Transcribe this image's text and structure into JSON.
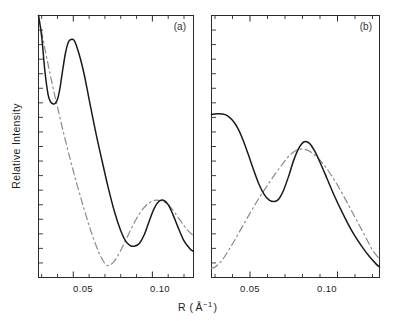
{
  "figure": {
    "xlabel_main": "R (",
    "xlabel_unit": "Å",
    "xlabel_exp": "−1",
    "xlabel_close": ")",
    "xlabel_full": "R ( Å⁻¹ )",
    "ylabel": "Relative Intensity",
    "background_color": "#ffffff",
    "solid_color": "#1a1a1a",
    "dashed_color": "#8a8a8a"
  },
  "panels": [
    {
      "label": "(a)",
      "xticks": [
        {
          "value": 0.05,
          "label": "0.05"
        },
        {
          "value": 0.1,
          "label": "0.10"
        }
      ]
    },
    {
      "label": "(b)",
      "xticks": [
        {
          "value": 0.05,
          "label": "0.05"
        },
        {
          "value": 0.1,
          "label": "0.10"
        }
      ]
    }
  ],
  "chart_data": {
    "type": "line",
    "title": "",
    "xlabel": "R ( Å⁻¹ )",
    "ylabel": "Relative Intensity",
    "grid": false,
    "legend": "none",
    "panels": [
      {
        "name": "(a)",
        "xlim": [
          0.028,
          0.126
        ],
        "ylim": [
          0,
          1
        ],
        "xticks_major": [
          0.05,
          0.1
        ],
        "xtick_labels": [
          "0.05",
          "0.10"
        ],
        "xticks_minor_step": 0.01,
        "yticks_minor_count": 17,
        "series": [
          {
            "name": "solid",
            "style": "solid",
            "x": [
              0.028,
              0.03,
              0.032,
              0.034,
              0.0355,
              0.037,
              0.0385,
              0.04,
              0.0415,
              0.043,
              0.045,
              0.047,
              0.049,
              0.0505,
              0.052,
              0.0545,
              0.057,
              0.06,
              0.064,
              0.068,
              0.072,
              0.076,
              0.08,
              0.083,
              0.086,
              0.089,
              0.092,
              0.095,
              0.098,
              0.101,
              0.104,
              0.107,
              0.11,
              0.113,
              0.116,
              0.12,
              0.124,
              0.126
            ],
            "y": [
              1.0,
              0.92,
              0.79,
              0.7,
              0.672,
              0.663,
              0.664,
              0.68,
              0.72,
              0.78,
              0.855,
              0.9,
              0.909,
              0.905,
              0.885,
              0.835,
              0.772,
              0.68,
              0.56,
              0.45,
              0.345,
              0.252,
              0.178,
              0.14,
              0.122,
              0.12,
              0.132,
              0.165,
              0.215,
              0.262,
              0.29,
              0.295,
              0.278,
              0.24,
              0.195,
              0.14,
              0.108,
              0.1
            ]
          },
          {
            "name": "dashed",
            "style": "dash-dot",
            "x": [
              0.028,
              0.031,
              0.034,
              0.037,
              0.04,
              0.044,
              0.048,
              0.052,
              0.056,
              0.06,
              0.063,
              0.066,
              0.069,
              0.071,
              0.073,
              0.076,
              0.079,
              0.082,
              0.086,
              0.09,
              0.094,
              0.098,
              0.102,
              0.106,
              0.109,
              0.112,
              0.116,
              0.12,
              0.124,
              0.126
            ],
            "y": [
              1.0,
              0.905,
              0.815,
              0.73,
              0.65,
              0.548,
              0.452,
              0.362,
              0.278,
              0.198,
              0.145,
              0.098,
              0.062,
              0.048,
              0.046,
              0.063,
              0.092,
              0.128,
              0.178,
              0.225,
              0.262,
              0.285,
              0.295,
              0.292,
              0.282,
              0.265,
              0.232,
              0.198,
              0.17,
              0.16
            ]
          }
        ]
      },
      {
        "name": "(b)",
        "xlim": [
          0.028,
          0.124
        ],
        "ylim": [
          0,
          1
        ],
        "xticks_major": [
          0.05,
          0.1
        ],
        "xtick_labels": [
          "0.05",
          "0.10"
        ],
        "xticks_minor_step": 0.01,
        "yticks_minor_count": 17,
        "series": [
          {
            "name": "solid",
            "style": "solid",
            "x": [
              0.028,
              0.031,
              0.034,
              0.037,
              0.04,
              0.043,
              0.046,
              0.049,
              0.052,
              0.055,
              0.058,
              0.061,
              0.064,
              0.0665,
              0.069,
              0.072,
              0.075,
              0.078,
              0.081,
              0.084,
              0.087,
              0.09,
              0.094,
              0.098,
              0.102,
              0.106,
              0.11,
              0.114,
              0.118,
              0.122,
              0.124
            ],
            "y": [
              0.622,
              0.625,
              0.624,
              0.618,
              0.6,
              0.57,
              0.525,
              0.47,
              0.412,
              0.358,
              0.318,
              0.295,
              0.29,
              0.3,
              0.33,
              0.385,
              0.448,
              0.495,
              0.518,
              0.512,
              0.482,
              0.44,
              0.378,
              0.315,
              0.258,
              0.205,
              0.158,
              0.118,
              0.082,
              0.052,
              0.04
            ]
          },
          {
            "name": "dashed",
            "style": "dash-dot",
            "x": [
              0.028,
              0.03,
              0.033,
              0.036,
              0.04,
              0.044,
              0.048,
              0.052,
              0.056,
              0.06,
              0.064,
              0.068,
              0.072,
              0.076,
              0.079,
              0.082,
              0.085,
              0.088,
              0.092,
              0.096,
              0.1,
              0.104,
              0.108,
              0.112,
              0.116,
              0.12,
              0.124
            ],
            "y": [
              0.035,
              0.04,
              0.058,
              0.085,
              0.128,
              0.175,
              0.222,
              0.268,
              0.312,
              0.352,
              0.392,
              0.428,
              0.462,
              0.484,
              0.49,
              0.488,
              0.478,
              0.462,
              0.432,
              0.395,
              0.352,
              0.305,
              0.255,
              0.205,
              0.155,
              0.105,
              0.07
            ]
          }
        ]
      }
    ]
  }
}
